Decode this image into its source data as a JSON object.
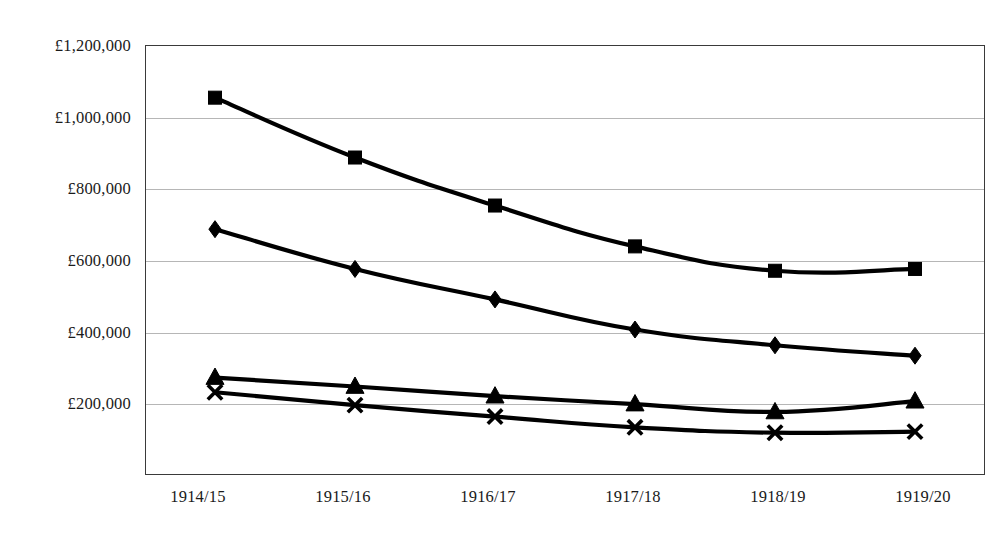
{
  "chart_data": {
    "type": "line",
    "title": "",
    "subtitle": "",
    "xlabel": "",
    "ylabel": "",
    "categories": [
      "1914/15",
      "1915/16",
      "1916/17",
      "1917/18",
      "1918/19",
      "1919/20"
    ],
    "ylim": [
      0,
      1200000
    ],
    "ytick_values": [
      200000,
      400000,
      600000,
      800000,
      1000000,
      1200000
    ],
    "ytick_labels": [
      "£200,000",
      "£400,000",
      "£600,000",
      "£800,000",
      "£1,000,000",
      "£1,200,000"
    ],
    "grid": true,
    "grid_axis": "y",
    "legend": "none",
    "legend_position": "none",
    "currency_symbol": "£",
    "series": [
      {
        "name": "Series 1",
        "marker": "square",
        "color": "#000000",
        "values": [
          1053000,
          886000,
          752000,
          638000,
          570000,
          575000
        ]
      },
      {
        "name": "Series 2",
        "marker": "diamond",
        "color": "#000000",
        "values": [
          686000,
          575000,
          490000,
          406000,
          362000,
          333000
        ]
      },
      {
        "name": "Series 3",
        "marker": "triangle",
        "color": "#000000",
        "values": [
          272000,
          247000,
          220000,
          198000,
          176000,
          206000
        ]
      },
      {
        "name": "Series 4",
        "marker": "cross",
        "color": "#000000",
        "values": [
          231000,
          195000,
          163000,
          133000,
          118000,
          121000
        ]
      }
    ]
  },
  "axes": {
    "y_labels": [
      "£1,200,000",
      "£1,000,000",
      "£800,000",
      "£600,000",
      "£400,000",
      "£200,000"
    ],
    "x_labels": [
      "1914/15",
      "1915/16",
      "1916/17",
      "1917/18",
      "1918/19",
      "1919/20"
    ]
  },
  "style": {
    "plot_border_color": "#3a3a3a",
    "gridline_color": "#b6b6b6",
    "line_color": "#000000",
    "background": "#ffffff"
  }
}
